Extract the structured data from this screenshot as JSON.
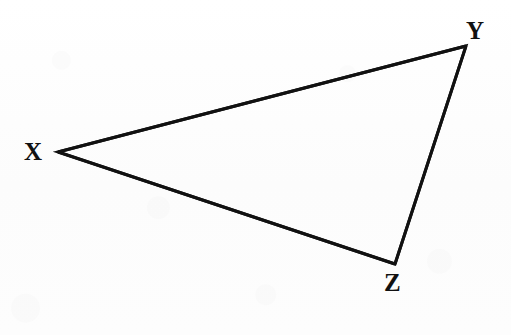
{
  "figure": {
    "kind": "geometry-diagram",
    "shape": "triangle",
    "canvas": {
      "width": 511,
      "height": 335
    },
    "background_color": "#fdfdfd",
    "stroke_color": "#111111",
    "stroke_width": 3,
    "label_color": "#111111",
    "vertices": [
      {
        "id": "X",
        "label": "X",
        "point": {
          "x": 58,
          "y": 152
        },
        "label_position": {
          "x": 34,
          "y": 151
        },
        "label_placement": "left"
      },
      {
        "id": "Y",
        "label": "Y",
        "point": {
          "x": 466,
          "y": 46
        },
        "label_position": {
          "x": 477,
          "y": 31
        },
        "label_placement": "above-right"
      },
      {
        "id": "Z",
        "label": "Z",
        "point": {
          "x": 395,
          "y": 264
        },
        "label_position": {
          "x": 393,
          "y": 283
        },
        "label_placement": "below"
      }
    ],
    "edges": [
      {
        "id": "XY",
        "from": "X",
        "to": "Y"
      },
      {
        "id": "YZ",
        "from": "Y",
        "to": "Z"
      },
      {
        "id": "ZX",
        "from": "Z",
        "to": "X"
      }
    ]
  }
}
